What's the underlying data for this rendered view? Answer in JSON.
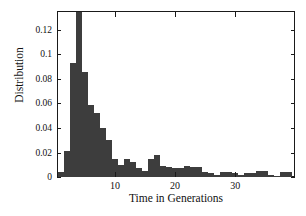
{
  "chart_data": {
    "type": "bar",
    "title": "",
    "subtitle": "",
    "xlabel": "Time in Generations",
    "ylabel": "Distribution",
    "xlim": [
      0.5,
      39.8
    ],
    "ylim": [
      0,
      0.1345
    ],
    "grid": false,
    "legend": null,
    "bar_color": "#3d3d3d",
    "axis_color": "#1a1a1a",
    "background": "#ffffff",
    "bin_width": 1,
    "xticks": [
      10,
      20,
      30
    ],
    "xtick_labels": [
      "10",
      "20",
      "30"
    ],
    "yticks": [
      0,
      0.02,
      0.04,
      0.06,
      0.08,
      0.1,
      0.12
    ],
    "ytick_labels": [
      "0",
      "0.02",
      "0.04",
      "0.06",
      "0.08",
      "0.1",
      "0.12"
    ],
    "note": "Peak bar at x=4 is clipped by the top of the axes",
    "x": [
      1,
      2,
      3,
      4,
      5,
      6,
      7,
      8,
      9,
      10,
      11,
      12,
      13,
      14,
      15,
      16,
      17,
      18,
      19,
      20,
      21,
      22,
      23,
      24,
      25,
      26,
      27,
      28,
      29,
      30,
      31,
      32,
      33,
      34,
      35,
      36,
      37,
      38,
      39
    ],
    "values": [
      0.004,
      0.021,
      0.093,
      0.135,
      0.086,
      0.059,
      0.052,
      0.04,
      0.03,
      0.015,
      0.01,
      0.015,
      0.012,
      0.007,
      0.005,
      0.015,
      0.018,
      0.009,
      0.008,
      0.007,
      0.007,
      0.009,
      0.008,
      0.008,
      0.004,
      0.003,
      0.002,
      0.004,
      0.004,
      0.003,
      0.002,
      0.003,
      0.003,
      0.005,
      0.005,
      0.002,
      0.001,
      0.004,
      0.004
    ]
  },
  "axes": {
    "ylabel": "Distribution",
    "xlabel": "Time in Generations"
  }
}
